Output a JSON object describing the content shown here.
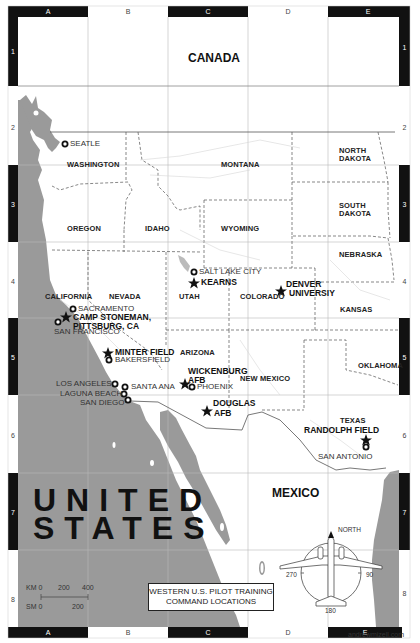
{
  "map": {
    "title_line1": "WESTERN U.S. PILOT TRAINING",
    "title_line2": "COMMAND LOCATIONS",
    "credit": "andrewmizell.com",
    "colors": {
      "water": "#9a9a9a",
      "land": "#ffffff",
      "frame": "#111111",
      "border": "#555555"
    },
    "grid": {
      "columns": [
        "A",
        "B",
        "C",
        "D",
        "E"
      ],
      "rows": [
        "1",
        "2",
        "3",
        "4",
        "5",
        "6",
        "7",
        "8"
      ]
    },
    "countries": {
      "canada": "CANADA",
      "united_states_line1": "UNITED",
      "united_states_line2": "STATES",
      "mexico": "MEXICO"
    },
    "states": {
      "washington": "WASHINGTON",
      "oregon": "OREGON",
      "idaho": "IDAHO",
      "montana": "MONTANA",
      "wyoming": "WYOMING",
      "north_dakota_1": "NORTH",
      "north_dakota_2": "DAKOTA",
      "south_dakota_1": "SOUTH",
      "south_dakota_2": "DAKOTA",
      "nebraska": "NEBRASKA",
      "california": "CALIFORNIA",
      "nevada": "NEVADA",
      "utah": "UTAH",
      "colorado": "COLORADO",
      "kansas": "KANSAS",
      "arizona": "ARIZONA",
      "new_mexico": "NEW MEXICO",
      "oklahoma": "OKLAHOMA",
      "texas": "TEXAS"
    },
    "cities": {
      "seattle": "SEATLE",
      "sacramento": "SACRAMENTO",
      "san_francisco": "SAN FRANCISCO",
      "salt_lake_city": "SALT LAKE CITY",
      "bakersfield": "BAKERSFIELD",
      "los_angeles": "LOS ANGELES",
      "santa_ana": "SANTA ANA",
      "laguna_beach": "LAGUNA BEACH",
      "san_diego": "SAN DIEGO",
      "phoenix": "PHOENIX",
      "san_antonio": "SAN ANTONIO"
    },
    "bases": {
      "kearns": "KEARNS",
      "denver_1": "DENVER",
      "denver_2": "UNIVERSIY",
      "camp_stoneman_1": "CAMP STONEMAN,",
      "camp_stoneman_2": "PITTSBURG, CA",
      "minter_field": "MINTER FIELD",
      "wickenburg_1": "WICKENBURG",
      "wickenburg_2": "AFB",
      "douglas_1": "DOUGLAS",
      "douglas_2": "AFB",
      "randolph_field": "RANDOLPH FIELD"
    },
    "scale": {
      "km_label": "KM 0",
      "km_mid": "200",
      "km_end": "400",
      "sm_label": "SM 0",
      "sm_mid": "200"
    },
    "compass": {
      "north": "NORTH",
      "east": "90",
      "south": "180",
      "west": "270"
    }
  }
}
